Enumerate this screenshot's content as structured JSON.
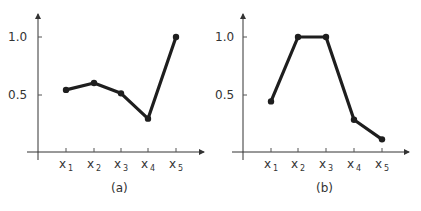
{
  "chart_data": [
    {
      "type": "line",
      "title": "",
      "caption": "(a)",
      "xlabel": "",
      "ylabel": "",
      "categories": [
        "x1",
        "x2",
        "x3",
        "x4",
        "x5"
      ],
      "values": [
        0.54,
        0.6,
        0.51,
        0.29,
        1.0
      ],
      "yticks": [
        "0.5",
        "1.0"
      ],
      "ylim": [
        0,
        1.2
      ],
      "grid": false,
      "legend": null
    },
    {
      "type": "line",
      "title": "",
      "caption": "(b)",
      "xlabel": "",
      "ylabel": "",
      "categories": [
        "x1",
        "x2",
        "x3",
        "x4",
        "x5"
      ],
      "values": [
        0.44,
        1.0,
        1.0,
        0.28,
        0.11
      ],
      "yticks": [
        "0.5",
        "1.0"
      ],
      "ylim": [
        0,
        1.2
      ],
      "grid": false,
      "legend": null
    }
  ],
  "charts": [
    {
      "caption": "(a)",
      "ytick_labels": [
        "1.0",
        "0.5"
      ],
      "xtick_labels": [
        {
          "base": "x",
          "sub": "1"
        },
        {
          "base": "x",
          "sub": "2"
        },
        {
          "base": "x",
          "sub": "3"
        },
        {
          "base": "x",
          "sub": "4"
        },
        {
          "base": "x",
          "sub": "5"
        }
      ]
    },
    {
      "caption": "(b)",
      "ytick_labels": [
        "1.0",
        "0.5"
      ],
      "xtick_labels": [
        {
          "base": "x",
          "sub": "1"
        },
        {
          "base": "x",
          "sub": "2"
        },
        {
          "base": "x",
          "sub": "3"
        },
        {
          "base": "x",
          "sub": "4"
        },
        {
          "base": "x",
          "sub": "5"
        }
      ]
    }
  ],
  "colors": {
    "line": "#1e1e1e",
    "axis": "#333333",
    "background": "#ffffff"
  }
}
